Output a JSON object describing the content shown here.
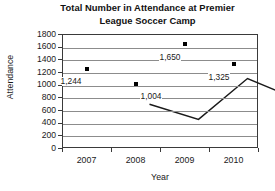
{
  "chart_data": {
    "type": "line",
    "title": "Total Number in Attendance at Premier League Soccer Camp",
    "title_line1": "Total Number in Attendance at Premier",
    "title_line2": "League Soccer Camp",
    "xlabel": "Year",
    "ylabel": "Attendance",
    "categories": [
      "2007",
      "2008",
      "2009",
      "2010"
    ],
    "values": [
      1244,
      1004,
      1650,
      1325
    ],
    "point_labels": [
      "1,244",
      "1,004",
      "1,650",
      "1,325"
    ],
    "yticks": [
      1800,
      1600,
      1400,
      1200,
      1000,
      800,
      600,
      400,
      200,
      0
    ],
    "ytick_labels": [
      "1800",
      "1600",
      "1400",
      "1200",
      "1000",
      "800",
      "600",
      "400",
      "200",
      "0"
    ],
    "ylim": [
      0,
      1800
    ],
    "grid": true,
    "legend": null,
    "legend_position": "none",
    "marker": "square",
    "series": [
      {
        "name": "Attendance",
        "color": "#000000",
        "values": [
          1244,
          1004,
          1650,
          1325
        ]
      }
    ]
  },
  "colors": {
    "line": "#1a1a1a",
    "marker": "#000000",
    "grid": "#8c8c8c",
    "axis": "#3a3a3a",
    "background": "#ffffff",
    "text": "#1a1a1a"
  }
}
